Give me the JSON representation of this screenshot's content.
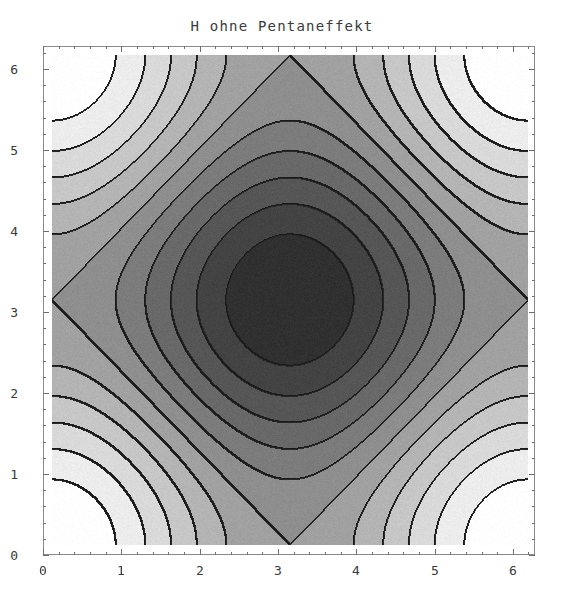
{
  "chart_data": {
    "type": "heatmap",
    "title": "H ohne Pentaneffekt",
    "xlabel": "",
    "ylabel": "",
    "xlim": [
      0,
      6.2832
    ],
    "ylim": [
      0,
      6.2832
    ],
    "x_tick_labels": [
      "0",
      "1",
      "2",
      "3",
      "4",
      "5",
      "6"
    ],
    "x_tick_values": [
      0,
      1,
      2,
      3,
      4,
      5,
      6
    ],
    "y_tick_labels": [
      "0",
      "1",
      "2",
      "3",
      "4",
      "5",
      "6"
    ],
    "y_tick_values": [
      0,
      1,
      2,
      3,
      4,
      5,
      6
    ],
    "minor_ticks_per_interval": 5,
    "grid": false,
    "legend": "none",
    "colormap": "grayscale",
    "colormap_low": "#303030",
    "colormap_high": "#ffffff",
    "contour_line_color": "#1a1a1a",
    "contour_levels": 12,
    "function": "cos(x) + cos(y)",
    "zlim": [
      -2,
      2
    ],
    "maxima": [
      {
        "x": 1.047,
        "y": 1.047,
        "z": 1.0
      },
      {
        "x": 3.142,
        "y": 1.047,
        "z": 1.5
      },
      {
        "x": 5.236,
        "y": 1.047,
        "z": 1.0
      },
      {
        "x": 1.047,
        "y": 3.142,
        "z": 1.5
      },
      {
        "x": 3.142,
        "y": 3.142,
        "z": 2.0
      },
      {
        "x": 5.236,
        "y": 3.142,
        "z": 1.5
      },
      {
        "x": 1.047,
        "y": 5.236,
        "z": 1.0
      },
      {
        "x": 3.142,
        "y": 5.236,
        "z": 1.5
      },
      {
        "x": 5.236,
        "y": 5.236,
        "z": 1.0
      }
    ],
    "minima": [
      {
        "x": 0.0,
        "y": 0.0,
        "z": -2.0
      },
      {
        "x": 2.094,
        "y": 2.094,
        "z": -1.4
      },
      {
        "x": 4.189,
        "y": 4.189,
        "z": -1.4
      },
      {
        "x": 2.094,
        "y": 4.189,
        "z": -1.4
      },
      {
        "x": 4.189,
        "y": 2.094,
        "z": -1.4
      },
      {
        "x": 6.283,
        "y": 0.0,
        "z": -2.0
      },
      {
        "x": 0.0,
        "y": 6.283,
        "z": -2.0
      },
      {
        "x": 6.283,
        "y": 6.283,
        "z": -2.0
      }
    ]
  },
  "plot": {
    "title": "H ohne Pentaneffekt"
  }
}
